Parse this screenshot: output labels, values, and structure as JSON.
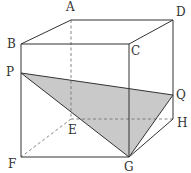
{
  "diagram": {
    "type": "cube-cross-section",
    "colors": {
      "edge": "#333333",
      "hidden_edge": "#777777",
      "shade": "#c9c9c9",
      "background": "#ffffff"
    },
    "vertices": {
      "A": {
        "x": 71,
        "y": 20,
        "label": "A",
        "lx": 66,
        "ly": 11
      },
      "B": {
        "x": 21,
        "y": 44,
        "label": "B",
        "lx": 7,
        "ly": 48
      },
      "C": {
        "x": 129,
        "y": 44,
        "label": "C",
        "lx": 131,
        "ly": 55
      },
      "D": {
        "x": 173,
        "y": 20,
        "label": "D",
        "lx": 176,
        "ly": 16
      },
      "E": {
        "x": 71,
        "y": 119,
        "label": "E",
        "lx": 68,
        "ly": 134
      },
      "F": {
        "x": 21,
        "y": 157,
        "label": "F",
        "lx": 8,
        "ly": 168
      },
      "G": {
        "x": 129,
        "y": 157,
        "label": "G",
        "lx": 124,
        "ly": 170
      },
      "H": {
        "x": 173,
        "y": 119,
        "label": "H",
        "lx": 177,
        "ly": 127
      },
      "P": {
        "x": 21,
        "y": 73,
        "label": "P",
        "lx": 6,
        "ly": 76
      },
      "Q": {
        "x": 173,
        "y": 95,
        "label": "Q",
        "lx": 176,
        "ly": 99
      }
    },
    "shaded_triangle": [
      "P",
      "Q",
      "G"
    ],
    "visible_edges": [
      [
        "A",
        "D"
      ],
      [
        "A",
        "B"
      ],
      [
        "B",
        "C"
      ],
      [
        "C",
        "D"
      ],
      [
        "B",
        "F"
      ],
      [
        "C",
        "G"
      ],
      [
        "D",
        "H"
      ],
      [
        "F",
        "G"
      ],
      [
        "G",
        "H"
      ],
      [
        "P",
        "Q"
      ],
      [
        "Q",
        "G"
      ],
      [
        "P",
        "G"
      ]
    ],
    "hidden_edges": [
      [
        "A",
        "E"
      ],
      [
        "E",
        "F"
      ],
      [
        "E",
        "H"
      ]
    ]
  }
}
